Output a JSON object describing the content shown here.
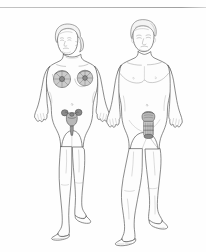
{
  "image": {
    "kind": "scanned-anatomical-line-drawing",
    "title": "Female and male human figures with reproductive anatomy overlays",
    "background_color": "#fefefe",
    "width_px": 206,
    "height_px": 252,
    "has_visible_text": false,
    "scan_artifact": {
      "name": "horizontal-scan-rule",
      "position": "top edge",
      "y_px": 7,
      "color": "#a9a9a9"
    }
  },
  "style": {
    "outline_color": "#5a5a5a",
    "detail_color": "#8d8d8d",
    "soft_detail_color": "#a8a8a8",
    "organ_fill_color": "#b8b8b8",
    "organ_dark_color": "#8a8a8a",
    "skin_fill_color": "#fdfdfd",
    "hair_fill_color": "#f4f4f4"
  },
  "figures": [
    {
      "id": "female-figure",
      "label": "Female figure, frontal view, standing",
      "side": "left",
      "pose": "standing, arms at sides, legs together",
      "hair": "short wavy hair with bun at nape",
      "center_x_px": 72,
      "top_px": 22,
      "bottom_px": 238,
      "overlays": [
        {
          "id": "mammary-gland-left",
          "label": "Left breast mammary gland overlay",
          "shape": "shaded circle with radiating lobules",
          "center_x_px": 62,
          "center_y_px": 79,
          "radius_px": 9
        },
        {
          "id": "mammary-gland-right",
          "label": "Right breast mammary gland overlay",
          "shape": "shaded circle with radiating lobules",
          "center_x_px": 85,
          "center_y_px": 78,
          "radius_px": 8
        },
        {
          "id": "uterus-ovaries",
          "label": "Uterus with fallopian tubes, ovaries and vagina overlay",
          "shape": "inverted pear body with two lateral ovary lobes and descending canal",
          "center_x_px": 72,
          "center_y_px": 118
        }
      ]
    },
    {
      "id": "male-figure",
      "label": "Male figure, frontal view, standing",
      "side": "right",
      "pose": "standing, arms at sides, legs slightly apart",
      "hair": "short cropped hair",
      "center_x_px": 147,
      "top_px": 18,
      "bottom_px": 240,
      "overlays": [
        {
          "id": "bladder-prostate-penis",
          "label": "Bladder, prostate and penis overlay",
          "shape": "rounded bladder dome above shaded rectangular prostate block with descending shaft",
          "center_x_px": 149,
          "center_y_px": 120
        },
        {
          "id": "navel-mark",
          "label": "Navel",
          "center_x_px": 147,
          "center_y_px": 105
        }
      ]
    }
  ]
}
